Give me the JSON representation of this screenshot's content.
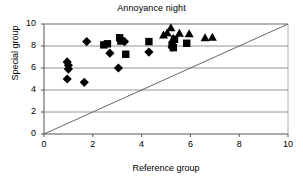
{
  "chart_data": {
    "type": "scatter",
    "title": "Annoyance night",
    "xlabel": "Reference group",
    "ylabel": "Special group",
    "xlim": [
      0,
      10
    ],
    "ylim": [
      0,
      10
    ],
    "xticks": [
      0,
      2,
      4,
      6,
      8,
      10
    ],
    "yticks": [
      0,
      2,
      4,
      6,
      8,
      10
    ],
    "grid": "horizontal",
    "legend": "none",
    "reference_line": {
      "name": "identity-line",
      "from": [
        0,
        0
      ],
      "to": [
        10,
        10
      ],
      "style": "solid-thin"
    },
    "series": [
      {
        "name": "diamond-series",
        "marker": "diamond",
        "color": "#000000",
        "points": [
          [
            0.95,
            6.55
          ],
          [
            1.0,
            6.25
          ],
          [
            1.0,
            5.9
          ],
          [
            0.95,
            5.0
          ],
          [
            1.65,
            4.7
          ],
          [
            1.75,
            8.4
          ],
          [
            2.7,
            7.35
          ],
          [
            3.05,
            6.0
          ],
          [
            3.3,
            8.4
          ],
          [
            4.3,
            7.45
          ],
          [
            5.25,
            7.9
          ]
        ]
      },
      {
        "name": "square-series",
        "marker": "square",
        "color": "#000000",
        "points": [
          [
            2.45,
            8.1
          ],
          [
            2.6,
            8.2
          ],
          [
            3.1,
            8.75
          ],
          [
            3.15,
            8.45
          ],
          [
            3.35,
            7.25
          ],
          [
            4.3,
            8.4
          ],
          [
            5.25,
            8.1
          ],
          [
            5.3,
            7.85
          ],
          [
            5.35,
            8.6
          ],
          [
            5.85,
            8.25
          ]
        ]
      },
      {
        "name": "triangle-series",
        "marker": "triangle",
        "color": "#000000",
        "points": [
          [
            4.9,
            9.05
          ],
          [
            5.05,
            9.25
          ],
          [
            5.2,
            9.7
          ],
          [
            5.3,
            8.75
          ],
          [
            5.55,
            9.2
          ],
          [
            5.95,
            9.15
          ],
          [
            6.6,
            8.8
          ],
          [
            6.9,
            8.85
          ]
        ]
      }
    ]
  }
}
